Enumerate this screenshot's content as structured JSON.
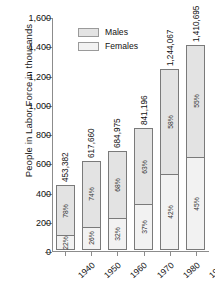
{
  "chart_data": {
    "type": "bar",
    "subtype": "stacked-bar-100-percent-annotated",
    "title": "",
    "xlabel": "",
    "ylabel": "People in Labor Force in thousands",
    "ylim": [
      0,
      1600
    ],
    "ytick_step": 200,
    "grid": false,
    "legend_position": "top-center-inside",
    "categories": [
      "1940",
      "1950",
      "1960",
      "1970",
      "1980",
      "1990"
    ],
    "ytick_labels": [
      "0",
      "200",
      "400",
      "600",
      "800",
      "1,000",
      "1,200",
      "1,400",
      "1,600"
    ],
    "ytick_values": [
      0,
      200,
      400,
      600,
      800,
      1000,
      1200,
      1400,
      1600
    ],
    "totals": [
      453382,
      617660,
      684975,
      841196,
      1244067,
      1410695
    ],
    "total_labels": [
      "453,382",
      "617,660",
      "684,975",
      "841,196",
      "1,244,067",
      "1,410,695"
    ],
    "series": [
      {
        "name": "Males",
        "color": "#e3e3e3",
        "stack_position": "top",
        "percent_values": [
          78,
          74,
          68,
          63,
          58,
          55
        ],
        "percent_labels": [
          "78%",
          "74%",
          "68%",
          "63%",
          "58%",
          "55%"
        ]
      },
      {
        "name": "Females",
        "color": "#f2f2f2",
        "stack_position": "bottom",
        "percent_values": [
          22,
          26,
          32,
          37,
          42,
          45
        ],
        "percent_labels": [
          "22%",
          "26%",
          "32%",
          "37%",
          "42%",
          "45%"
        ]
      }
    ]
  },
  "legend": {
    "items": [
      {
        "label": "Males",
        "color": "#e3e3e3"
      },
      {
        "label": "Females",
        "color": "#f2f2f2"
      }
    ]
  },
  "axis": {
    "y_title": "People in Labor Force in thousands"
  }
}
